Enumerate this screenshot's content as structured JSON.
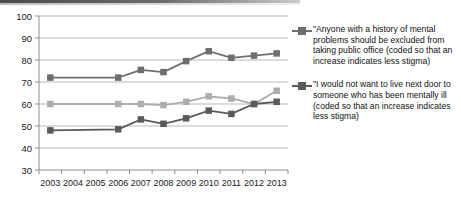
{
  "chart_data": {
    "type": "line",
    "title": "",
    "xlabel": "",
    "ylabel": "",
    "categories": [
      "2003",
      "2004",
      "2005",
      "2006",
      "2007",
      "2008",
      "2009",
      "2010",
      "2011",
      "2012",
      "2013"
    ],
    "ylim": [
      30,
      100
    ],
    "yticks": [
      30,
      40,
      50,
      60,
      70,
      80,
      90,
      100
    ],
    "grid": true,
    "legend_position": "right",
    "series": [
      {
        "name": "\"Anyone with a history of mental problems should be excluded from taking public office (coded so that an increase indicates less stigma)",
        "color": "#6e6e6e",
        "marker": "square",
        "values": [
          72,
          null,
          null,
          72,
          75.5,
          74.5,
          79.5,
          84,
          81,
          82,
          83
        ]
      },
      {
        "name": "middle-series",
        "color": "#adadad",
        "marker": "square",
        "values": [
          60,
          null,
          null,
          60,
          60,
          59.5,
          61,
          63.5,
          62.5,
          60,
          66
        ]
      },
      {
        "name": "\"I would not want to live next door to someone who has been mentally ill  (coded so that an increase indicates less stigma)",
        "color": "#5a5a5a",
        "marker": "square",
        "values": [
          48,
          null,
          null,
          48.5,
          53,
          51,
          53.5,
          57,
          55.5,
          60,
          61
        ]
      }
    ]
  },
  "axes": {
    "y_labels": [
      "100",
      "90",
      "80",
      "70",
      "60",
      "50",
      "40",
      "30"
    ],
    "x_labels": [
      "2003",
      "2004",
      "2005",
      "2006",
      "2007",
      "2008",
      "2009",
      "2010",
      "2011",
      "2012",
      "2013"
    ]
  },
  "legend": {
    "entries": [
      {
        "label": "\"Anyone with a history of mental problems should be excluded from taking public office (coded so that an increase indicates less stigma)",
        "color": "#6e6e6e"
      },
      {
        "label": "\"I would not want to live next door to someone who has been mentally ill  (coded so that an increase indicates less stigma)",
        "color": "#5a5a5a"
      }
    ]
  },
  "colors": {
    "series_top": "#6e6e6e",
    "series_middle": "#adadad",
    "series_bottom": "#5a5a5a",
    "gridline": "#b9b9b9",
    "axis": "#8d8d8d",
    "text": "#111111"
  }
}
